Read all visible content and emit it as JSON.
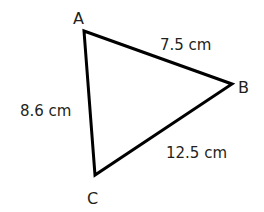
{
  "diagram": {
    "type": "triangle",
    "stroke_color": "#000000",
    "text_color": "#231f20",
    "vertices": [
      {
        "name": "A",
        "x": 84,
        "y": 31
      },
      {
        "name": "B",
        "x": 232,
        "y": 84
      },
      {
        "name": "C",
        "x": 95,
        "y": 175
      }
    ],
    "vertex_labels": {
      "a": "A",
      "b": "B",
      "c": "C"
    },
    "sides": {
      "ab": {
        "label": "7.5 cm",
        "value": 7.5,
        "unit": "cm"
      },
      "ac": {
        "label": "8.6 cm",
        "value": 8.6,
        "unit": "cm"
      },
      "bc": {
        "label": "12.5 cm",
        "value": 12.5,
        "unit": "cm"
      }
    }
  }
}
